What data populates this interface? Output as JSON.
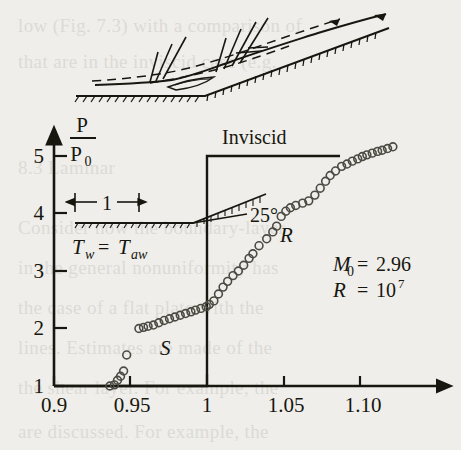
{
  "figure": {
    "type": "scatter",
    "caption_labels": {
      "inviscid": "Inviscid",
      "separation": "S",
      "reattachment": "R"
    },
    "y_axis": {
      "numerator": "P",
      "denominator": "P",
      "denominator_sub": "0",
      "ticks": [
        "1",
        "2",
        "3",
        "4",
        "5"
      ],
      "tick_values": [
        1,
        2,
        3,
        4,
        5
      ],
      "min": 1,
      "max": 5.35
    },
    "x_axis": {
      "ticks": [
        "0.9",
        "0.95",
        "1",
        "1.05",
        "1.10"
      ],
      "tick_values": [
        0.9,
        0.95,
        1.0,
        1.05,
        1.1
      ],
      "min": 0.895,
      "max": 1.135
    },
    "conditions": {
      "mach_symbol": "M",
      "mach_sub": "0",
      "mach_eq": "=",
      "mach_value": "2.96",
      "reynolds_symbol": "R",
      "reynolds_eq": "=",
      "reynolds_base": "10",
      "reynolds_exp": "7"
    },
    "inset": {
      "length_label": "1",
      "ramp_angle": "25°",
      "wall_temp_lhs": "T",
      "wall_temp_lhs_sub": "w",
      "wall_temp_eq": "=",
      "wall_temp_rhs": "T",
      "wall_temp_rhs_sub": "aw"
    },
    "inviscid_curve": {
      "x_jump": 1.0,
      "y_before": 1.0,
      "y_after": 5.0,
      "x_end": 1.083
    },
    "colors": {
      "ink": "#17160f",
      "paper": "#efeeea",
      "marker_stroke": "#4c4a42"
    }
  },
  "chart_data": {
    "type": "scatter",
    "title": "",
    "xlabel": "",
    "ylabel": "P/P0",
    "xlim": [
      0.895,
      1.135
    ],
    "ylim": [
      1.0,
      5.35
    ],
    "grid": false,
    "legend": "none",
    "annotations": [
      {
        "text": "Inviscid",
        "x": 1.005,
        "y": 5.3
      },
      {
        "text": "S",
        "x": 0.967,
        "y": 1.55
      },
      {
        "text": "R",
        "x": 1.037,
        "y": 3.55
      },
      {
        "text": "M0 = 2.96",
        "x": 1.085,
        "y": 3.05
      },
      {
        "text": "R = 10^7",
        "x": 1.085,
        "y": 2.7
      },
      {
        "text": "25°",
        "x": 0.969,
        "y": 3.82
      },
      {
        "text": "Tw = Taw",
        "x": 0.935,
        "y": 3.38
      },
      {
        "text": "1",
        "x": 0.929,
        "y": 4.24
      }
    ],
    "series": [
      {
        "name": "Experimental wall pressure",
        "marker": "open-circle",
        "x": [
          0.9365,
          0.9395,
          0.9415,
          0.9435,
          0.9455,
          0.9475,
          0.9555,
          0.9585,
          0.9615,
          0.965,
          0.9685,
          0.972,
          0.9755,
          0.979,
          0.9825,
          0.986,
          0.9895,
          0.9925,
          0.996,
          0.9995,
          1.0015,
          1.0045,
          1.0075,
          1.0105,
          1.0135,
          1.017,
          1.0205,
          1.024,
          1.0275,
          1.03,
          1.034,
          1.039,
          1.043,
          1.0455,
          1.0485,
          1.0515,
          1.0545,
          1.058,
          1.0625,
          1.0665,
          1.0705,
          1.074,
          1.0775,
          1.0805,
          1.084,
          1.088,
          1.0915,
          1.095,
          1.0985,
          1.1015,
          1.1045,
          1.108,
          1.1115,
          1.1145,
          1.118,
          1.1215
        ],
        "y": [
          1.0,
          1.02,
          1.1,
          1.17,
          1.26,
          1.54,
          2.0,
          2.02,
          2.04,
          2.06,
          2.1,
          2.14,
          2.17,
          2.2,
          2.23,
          2.26,
          2.29,
          2.32,
          2.35,
          2.38,
          2.42,
          2.48,
          2.6,
          2.72,
          2.82,
          2.92,
          3.0,
          3.1,
          3.22,
          3.3,
          3.44,
          3.56,
          3.68,
          3.78,
          3.95,
          4.04,
          4.1,
          4.14,
          4.18,
          4.22,
          4.32,
          4.44,
          4.56,
          4.66,
          4.74,
          4.82,
          4.86,
          4.91,
          4.95,
          4.99,
          5.02,
          5.05,
          5.08,
          5.1,
          5.13,
          5.16
        ]
      }
    ],
    "reference_curve": {
      "name": "Inviscid",
      "type": "step",
      "x": [
        0.895,
        1.0,
        1.0,
        1.083
      ],
      "y": [
        1.0,
        1.0,
        5.0,
        5.0
      ]
    }
  }
}
